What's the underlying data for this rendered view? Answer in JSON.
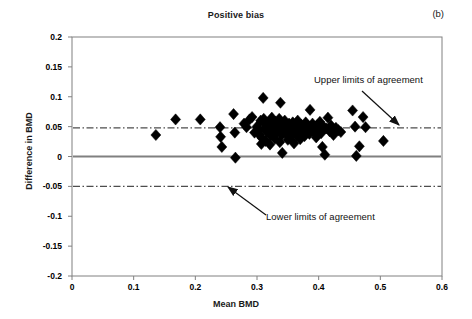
{
  "figure": {
    "title": "Positive bias",
    "panel_label": "(b)",
    "x_axis_title": "Mean BMD",
    "y_axis_title": "Difference in BMD",
    "annotations": {
      "upper": "Upper limits of agreement",
      "lower": "Lower limits of agreement"
    },
    "colors": {
      "marker": "#000000",
      "axis": "#808080",
      "zero_line": "#808080",
      "limit_line": "#4d4d4d",
      "text": "#1a1a1a",
      "background": "#ffffff"
    }
  },
  "chart_data": {
    "type": "scatter",
    "title": "Positive bias",
    "subtitle": "(b)",
    "xlabel": "Mean BMD",
    "ylabel": "Difference in BMD",
    "xlim": [
      0,
      0.6
    ],
    "ylim": [
      -0.2,
      0.2
    ],
    "xticks": [
      0,
      0.1,
      0.2,
      0.3,
      0.4,
      0.5,
      0.6
    ],
    "xtick_labels": [
      "0",
      "0.1",
      "0.2",
      "0.3",
      "0.4",
      "0.5",
      "0.6"
    ],
    "yticks": [
      0.2,
      0.15,
      0.1,
      0.05,
      0,
      -0.05,
      -0.1,
      -0.15,
      -0.2
    ],
    "ytick_labels": [
      "0.2",
      "0.15",
      "0.1",
      "0.05",
      "0",
      "-0.05",
      "-0.1",
      "-0.15",
      "-0.2"
    ],
    "grid": false,
    "legend": null,
    "marker": "diamond",
    "marker_color": "#000000",
    "reference_lines": [
      {
        "name": "zero-line",
        "y": 0.0,
        "style": "solid",
        "color": "#808080",
        "label": ""
      },
      {
        "name": "upper-limit-of-agreement",
        "y": 0.048,
        "style": "dash-dot",
        "color": "#4d4d4d",
        "label": "Upper limits of agreement"
      },
      {
        "name": "lower-limit-of-agreement",
        "y": -0.05,
        "style": "dash-dot",
        "color": "#4d4d4d",
        "label": "Lower limits of agreement"
      }
    ],
    "annotations": [
      {
        "text": "Upper limits of agreement",
        "x": 0.395,
        "y": 0.115,
        "arrow_to": {
          "x": 0.527,
          "y": 0.049
        }
      },
      {
        "text": "Lower limits of agreement",
        "x": 0.315,
        "y": -0.097,
        "arrow_to": {
          "x": 0.253,
          "y": -0.052
        }
      }
    ],
    "points": [
      [
        0.136,
        0.036
      ],
      [
        0.168,
        0.062
      ],
      [
        0.208,
        0.062
      ],
      [
        0.24,
        0.049
      ],
      [
        0.241,
        0.033
      ],
      [
        0.243,
        0.016
      ],
      [
        0.262,
        0.071
      ],
      [
        0.264,
        0.04
      ],
      [
        0.265,
        -0.002
      ],
      [
        0.279,
        0.055
      ],
      [
        0.283,
        0.049
      ],
      [
        0.288,
        0.062
      ],
      [
        0.292,
        0.066
      ],
      [
        0.296,
        0.04
      ],
      [
        0.3,
        0.05
      ],
      [
        0.302,
        0.044
      ],
      [
        0.304,
        0.036
      ],
      [
        0.306,
        0.06
      ],
      [
        0.307,
        0.021
      ],
      [
        0.308,
        0.031
      ],
      [
        0.31,
        0.098
      ],
      [
        0.311,
        0.063
      ],
      [
        0.312,
        0.046
      ],
      [
        0.313,
        0.054
      ],
      [
        0.314,
        0.026
      ],
      [
        0.316,
        0.041
      ],
      [
        0.318,
        0.057
      ],
      [
        0.32,
        0.049
      ],
      [
        0.321,
        0.02
      ],
      [
        0.322,
        0.035
      ],
      [
        0.324,
        0.065
      ],
      [
        0.326,
        0.043
      ],
      [
        0.327,
        0.052
      ],
      [
        0.329,
        0.03
      ],
      [
        0.33,
        0.058
      ],
      [
        0.332,
        0.04
      ],
      [
        0.334,
        0.047
      ],
      [
        0.336,
        0.063
      ],
      [
        0.337,
        0.024
      ],
      [
        0.338,
        0.09
      ],
      [
        0.339,
        0.053
      ],
      [
        0.34,
        0.036
      ],
      [
        0.341,
        0.006
      ],
      [
        0.343,
        0.045
      ],
      [
        0.345,
        0.06
      ],
      [
        0.347,
        0.038
      ],
      [
        0.348,
        0.05
      ],
      [
        0.35,
        0.028
      ],
      [
        0.352,
        0.055
      ],
      [
        0.353,
        0.042
      ],
      [
        0.355,
        0.033
      ],
      [
        0.356,
        0.048
      ],
      [
        0.358,
        0.057
      ],
      [
        0.36,
        0.022
      ],
      [
        0.361,
        0.044
      ],
      [
        0.363,
        0.051
      ],
      [
        0.365,
        0.035
      ],
      [
        0.366,
        0.06
      ],
      [
        0.368,
        0.046
      ],
      [
        0.37,
        0.029
      ],
      [
        0.372,
        0.053
      ],
      [
        0.374,
        0.04
      ],
      [
        0.375,
        0.049
      ],
      [
        0.377,
        0.034
      ],
      [
        0.379,
        0.057
      ],
      [
        0.381,
        0.044
      ],
      [
        0.383,
        0.051
      ],
      [
        0.385,
        0.038
      ],
      [
        0.386,
        0.078
      ],
      [
        0.388,
        0.047
      ],
      [
        0.39,
        0.055
      ],
      [
        0.392,
        0.041
      ],
      [
        0.394,
        0.049
      ],
      [
        0.396,
        0.032
      ],
      [
        0.398,
        0.053
      ],
      [
        0.4,
        0.045
      ],
      [
        0.402,
        0.058
      ],
      [
        0.404,
        0.039
      ],
      [
        0.406,
        0.016
      ],
      [
        0.408,
        0.05
      ],
      [
        0.41,
        0.003
      ],
      [
        0.412,
        0.047
      ],
      [
        0.415,
        0.065
      ],
      [
        0.418,
        0.042
      ],
      [
        0.42,
        0.052
      ],
      [
        0.424,
        0.036
      ],
      [
        0.428,
        0.048
      ],
      [
        0.432,
        0.044
      ],
      [
        0.436,
        0.041
      ],
      [
        0.455,
        0.077
      ],
      [
        0.459,
        0.05
      ],
      [
        0.461,
        0.001
      ],
      [
        0.466,
        0.017
      ],
      [
        0.472,
        0.066
      ],
      [
        0.476,
        0.049
      ],
      [
        0.505,
        0.026
      ]
    ]
  }
}
